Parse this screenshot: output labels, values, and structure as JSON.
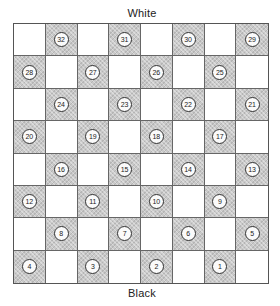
{
  "labels": {
    "top": "White",
    "bottom": "Black"
  },
  "board": {
    "rows": 8,
    "cols": 8,
    "dark_color": "#c9c9c9",
    "light_color": "#ffffff",
    "squares": [
      [
        null,
        "32",
        null,
        "31",
        null,
        "30",
        null,
        "29"
      ],
      [
        "28",
        null,
        "27",
        null,
        "26",
        null,
        "25",
        null
      ],
      [
        null,
        "24",
        null,
        "23",
        null,
        "22",
        null,
        "21"
      ],
      [
        "20",
        null,
        "19",
        null,
        "18",
        null,
        "17",
        null
      ],
      [
        null,
        "16",
        null,
        "15",
        null,
        "14",
        null,
        "13"
      ],
      [
        "12",
        null,
        "11",
        null,
        "10",
        null,
        "9",
        null
      ],
      [
        null,
        "8",
        null,
        "7",
        null,
        "6",
        null,
        "5"
      ],
      [
        "4",
        null,
        "3",
        null,
        "2",
        null,
        "1",
        null
      ]
    ]
  }
}
